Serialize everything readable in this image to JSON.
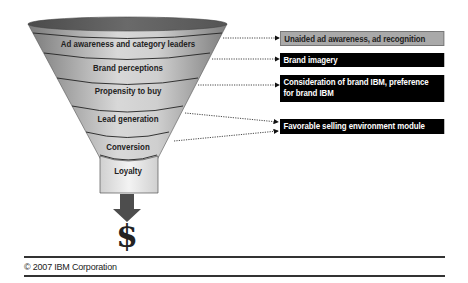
{
  "funnel": {
    "stages": [
      {
        "label": "Ad awareness and category leaders"
      },
      {
        "label": "Brand perceptions"
      },
      {
        "label": "Propensity to buy"
      },
      {
        "label": "Lead generation"
      },
      {
        "label": "Conversion"
      },
      {
        "label": "Loyalty"
      }
    ],
    "output_icon": "dollar-sign-icon",
    "output_symbol": "$"
  },
  "metrics": [
    {
      "label": "Unaided ad awareness, ad recognition",
      "style": "gray"
    },
    {
      "label": "Brand imagery",
      "style": "black"
    },
    {
      "label": "Consideration of brand IBM, preference for brand IBM",
      "style": "black"
    },
    {
      "label": "Favorable selling environment module",
      "style": "black"
    }
  ],
  "footer": {
    "copyright": "© 2007 IBM Corporation"
  },
  "colors": {
    "funnel_dark": "#6e6e6e",
    "funnel_light": "#dcdcdc",
    "box_black": "#000000",
    "box_gray": "#a9a9a9"
  }
}
